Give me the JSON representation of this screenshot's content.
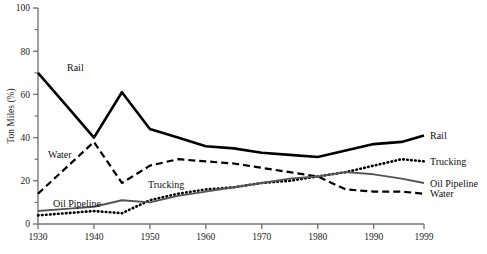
{
  "chart_data": {
    "type": "line",
    "title": "",
    "subtitle": "",
    "xlabel": "",
    "ylabel": "Ton Miles (%)",
    "xlim": [
      1930,
      1999
    ],
    "ylim": [
      0,
      100
    ],
    "grid": false,
    "legend_position": "right-inline",
    "x_ticks": [
      "1930",
      "1940",
      "1950",
      "1960",
      "1970",
      "1980",
      "1990",
      "1999"
    ],
    "x_tick_values": [
      1930,
      1940,
      1950,
      1960,
      1970,
      1980,
      1990,
      1999
    ],
    "y_ticks": [
      "0",
      "20",
      "40",
      "60",
      "80",
      "100"
    ],
    "y_tick_values": [
      0,
      20,
      40,
      60,
      80,
      100
    ],
    "y_minor_ticks": [
      10,
      30,
      50,
      70,
      90
    ],
    "x": [
      1930,
      1935,
      1940,
      1945,
      1950,
      1955,
      1960,
      1965,
      1970,
      1975,
      1980,
      1985,
      1990,
      1995,
      1999
    ],
    "series": [
      {
        "name": "Rail",
        "style": "solid-thick",
        "color": "#000000",
        "values": [
          70,
          55,
          40,
          61,
          44,
          40,
          36,
          35,
          33,
          32,
          31,
          34,
          37,
          38,
          41
        ]
      },
      {
        "name": "Water",
        "style": "dashed",
        "color": "#000000",
        "values": [
          14,
          26,
          38,
          19,
          27,
          30,
          29,
          28,
          26,
          24,
          22,
          16,
          15,
          15,
          14
        ]
      },
      {
        "name": "Trucking",
        "style": "dotted",
        "color": "#000000",
        "values": [
          4,
          5,
          6,
          5,
          11,
          14,
          16,
          17,
          19,
          20,
          22,
          24,
          27,
          30,
          29
        ]
      },
      {
        "name": "Oil Pipeline",
        "style": "solid-thin",
        "color": "#555555",
        "values": [
          6,
          7,
          8,
          11,
          10,
          13,
          15,
          17,
          19,
          21,
          22,
          24,
          23,
          21,
          19
        ]
      }
    ],
    "inline_annotations": [
      {
        "text": "Rail",
        "x_px": 67,
        "y_px": 71
      },
      {
        "text": "Water",
        "x_px": 48,
        "y_px": 158
      },
      {
        "text": "Trucking",
        "x_px": 148,
        "y_px": 188
      },
      {
        "text": "Oil Pipeline",
        "x_px": 53,
        "y_px": 207
      }
    ],
    "right_labels": [
      {
        "text": "Rail",
        "y_value": 41
      },
      {
        "text": "Trucking",
        "y_value": 29
      },
      {
        "text": "Oil Pipeline",
        "y_value": 19
      },
      {
        "text": "Water",
        "y_value": 14
      }
    ]
  }
}
